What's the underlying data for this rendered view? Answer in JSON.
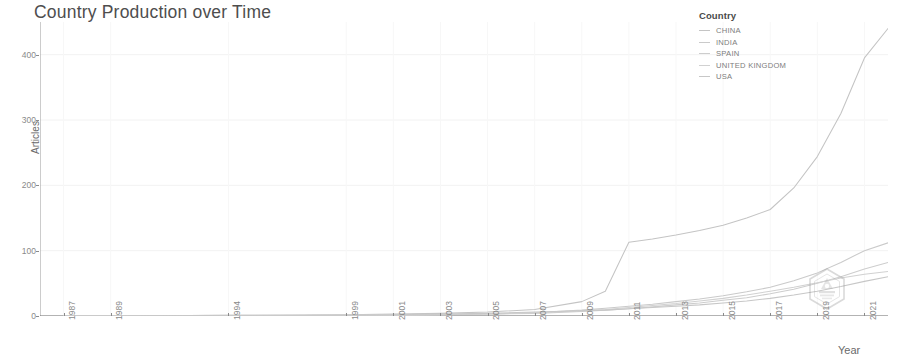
{
  "chart_data": {
    "type": "line",
    "title": "Country Production over Time",
    "xlabel": "Year",
    "ylabel": "Articles",
    "xlim": [
      1986,
      2022
    ],
    "ylim": [
      0,
      450
    ],
    "yticks": [
      0,
      100,
      200,
      300,
      400
    ],
    "ytick_labels": [
      "0",
      "100",
      "200",
      "300",
      "400"
    ],
    "xticks": [
      1987,
      1989,
      1994,
      1999,
      2001,
      2003,
      2005,
      2007,
      2009,
      2011,
      2013,
      2015,
      2017,
      2019,
      2021
    ],
    "xtick_labels": [
      "1987",
      "1989",
      "1994",
      "1999",
      "2001",
      "2003",
      "2005",
      "2007",
      "2009",
      "2011",
      "2013",
      "2015",
      "2017",
      "2019",
      "2021"
    ],
    "grid": true,
    "legend_position": "top-right",
    "legend_title": "Country",
    "x": [
      1987,
      1989,
      1994,
      1999,
      2001,
      2003,
      2005,
      2007,
      2009,
      2010,
      2011,
      2012,
      2013,
      2014,
      2015,
      2016,
      2017,
      2018,
      2019,
      2020,
      2021,
      2022
    ],
    "series": [
      {
        "name": "CHINA",
        "color": "#c4c4c4",
        "values": [
          0,
          0,
          1,
          2,
          3,
          4,
          6,
          10,
          22,
          38,
          113,
          118,
          124,
          131,
          139,
          150,
          163,
          196,
          244,
          310,
          395,
          440
        ]
      },
      {
        "name": "INDIA",
        "color": "#cacaca",
        "values": [
          0,
          0,
          0,
          1,
          1,
          2,
          3,
          5,
          9,
          12,
          15,
          18,
          22,
          26,
          31,
          37,
          44,
          54,
          66,
          82,
          100,
          112
        ]
      },
      {
        "name": "SPAIN",
        "color": "#cdcdcd",
        "values": [
          0,
          0,
          0,
          1,
          1,
          2,
          3,
          4,
          7,
          9,
          11,
          14,
          17,
          20,
          24,
          28,
          34,
          41,
          50,
          60,
          72,
          82
        ]
      },
      {
        "name": "UNITED KINGDOM",
        "color": "#d1d1d1",
        "values": [
          0,
          0,
          0,
          1,
          1,
          2,
          3,
          5,
          8,
          10,
          13,
          16,
          19,
          23,
          27,
          32,
          38,
          44,
          51,
          58,
          64,
          68
        ]
      },
      {
        "name": "USA",
        "color": "#c7c7c7",
        "values": [
          0,
          0,
          1,
          1,
          2,
          3,
          4,
          6,
          8,
          9,
          11,
          13,
          15,
          17,
          20,
          23,
          27,
          32,
          38,
          45,
          53,
          60
        ]
      }
    ]
  },
  "watermark": {
    "name": "hexagon-logo-watermark"
  }
}
